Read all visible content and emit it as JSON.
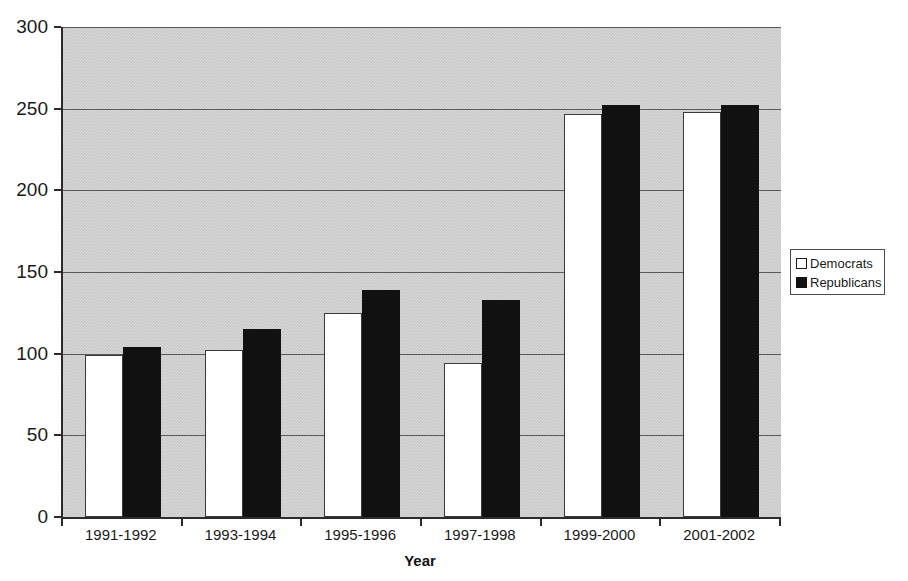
{
  "chart_data": {
    "type": "bar",
    "title": "",
    "subtitle": "",
    "xlabel": "Year",
    "ylabel": "",
    "categories": [
      "1991-1992",
      "1993-1994",
      "1995-1996",
      "1997-1998",
      "1999-2000",
      "2001-2002"
    ],
    "series": [
      {
        "name": "Democrats",
        "color": "#ffffff",
        "values": [
          99,
          102,
          125,
          94,
          247,
          248
        ]
      },
      {
        "name": "Republicans",
        "color": "#111111",
        "values": [
          104,
          115,
          139,
          133,
          252,
          252
        ]
      }
    ],
    "ylim": [
      0,
      300
    ],
    "ytick_labels": [
      "300",
      "250",
      "200",
      "150",
      "100",
      "50",
      "0"
    ],
    "ytick_values": [
      300,
      250,
      200,
      150,
      100,
      50,
      0
    ],
    "grid": true,
    "grid_axis": "y",
    "legend_position": "right",
    "plot_background": "#c9c9c9",
    "axis_color": "#2b2b2b",
    "gridline_color": "#5a5a5a"
  },
  "legend": {
    "entries": [
      {
        "label": "Democrats",
        "swatch": "white-square-icon"
      },
      {
        "label": "Republicans",
        "swatch": "black-square-icon"
      }
    ]
  },
  "axes": {
    "x_title": "Year"
  }
}
